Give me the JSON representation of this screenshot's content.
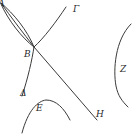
{
  "figure": {
    "type": "geometric diagram",
    "stroke_color": "#3a3a3a",
    "background": "#ffffff",
    "labels": {
      "A": "A",
      "B": "B",
      "G": "Γ",
      "D": "Δ",
      "E": "E",
      "Z": "Z",
      "H": "H"
    }
  }
}
